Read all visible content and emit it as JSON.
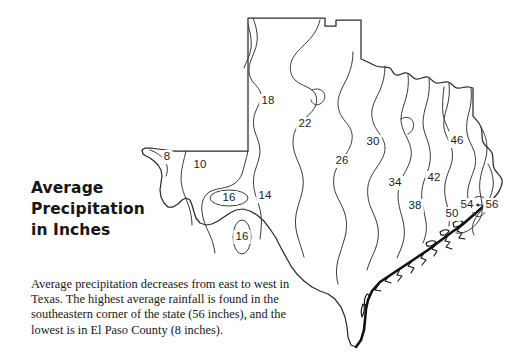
{
  "title": {
    "line1": "Average",
    "line2": "Precipitation",
    "line3": "in Inches"
  },
  "caption": {
    "line1": "Average precipitation decreases from east to west in",
    "line2": "Texas. The highest average rainfall is found in the",
    "line3": "southeastern corner of the state (56 inches), and the",
    "line4": "lowest is in El Paso County (8 inches)."
  },
  "map": {
    "region": "Texas",
    "outline_color": "#2a2a2a",
    "contour_color": "#3a3a3a",
    "coast_color": "#111111",
    "background": "#ffffff"
  },
  "chart_data": {
    "type": "contour-map",
    "title": "Average Precipitation in Inches",
    "units": "inches",
    "region": "Texas",
    "value_min": 8,
    "value_max": 56,
    "contour_interval": 4,
    "contour_labels": [
      {
        "value": 8,
        "x": 27,
        "y": 153,
        "note": "El Paso County, lowest"
      },
      {
        "value": 10,
        "x": 60,
        "y": 161
      },
      {
        "value": 16,
        "x": 89,
        "y": 194,
        "closed": true
      },
      {
        "value": 14,
        "x": 125,
        "y": 192
      },
      {
        "value": 16,
        "x": 102,
        "y": 233,
        "closed": true
      },
      {
        "value": 18,
        "x": 128,
        "y": 97
      },
      {
        "value": 22,
        "x": 165,
        "y": 120
      },
      {
        "value": 26,
        "x": 202,
        "y": 157
      },
      {
        "value": 30,
        "x": 233,
        "y": 138
      },
      {
        "value": 34,
        "x": 255,
        "y": 179
      },
      {
        "value": 38,
        "x": 275,
        "y": 202
      },
      {
        "value": 42,
        "x": 294,
        "y": 174
      },
      {
        "value": 46,
        "x": 317,
        "y": 137
      },
      {
        "value": 50,
        "x": 312,
        "y": 210
      },
      {
        "value": 54,
        "x": 327,
        "y": 201
      },
      {
        "value": 56,
        "x": 352,
        "y": 201,
        "note": "southeastern corner, highest"
      }
    ],
    "gradient_direction": "decreases from east to west"
  }
}
